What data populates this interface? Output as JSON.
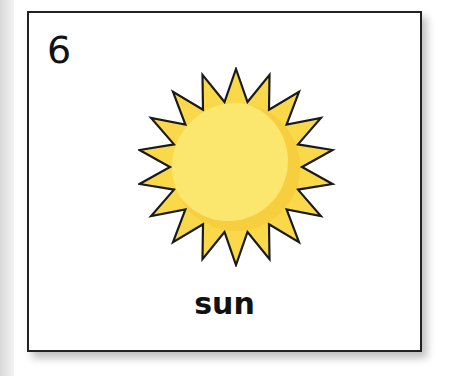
{
  "card": {
    "number": "6",
    "word": "sun",
    "image": "sun-icon"
  },
  "colors": {
    "sun_fill": "#fbe468",
    "sun_shade": "#f6c638",
    "outline": "#222222"
  }
}
